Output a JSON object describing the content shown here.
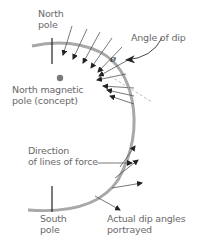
{
  "labels": {
    "north_pole": [
      "North",
      "pole"
    ],
    "angle_of_dip": "Angle of dip",
    "theta_symbol": "ø",
    "north_magnetic_pole": [
      "North magnetic",
      "pole (concept)"
    ],
    "direction_lines": [
      "Direction",
      "of lines of force"
    ],
    "south_pole": [
      "South",
      "pole"
    ],
    "actual_dip": [
      "Actual dip angles",
      "portrayed"
    ]
  },
  "colors": {
    "earth_arc": "#a8a8a8",
    "arrow": "#222222",
    "field_line": "#555555",
    "dashed_tangent": "#b0b0b0",
    "magnetic_pole_dot": "#7a7a7a",
    "axis_tick": "#222222",
    "text": "#6a6a6a"
  }
}
